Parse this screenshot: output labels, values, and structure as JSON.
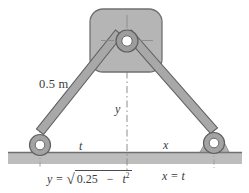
{
  "figure": {
    "labels": {
      "link_length": "0.5 m",
      "vertical_coordinate": "y",
      "left_horizontal_coordinate": "t",
      "right_horizontal_coordinate": "x"
    },
    "equations": {
      "left_y_prefix": "y =",
      "left_radical_sign": "√",
      "left_radicand_a": "0.25",
      "left_radicand_minus": "−",
      "left_radicand_t": "t",
      "left_radicand_exp": "2",
      "right": "x = t"
    },
    "colors": {
      "body_fill": "#b3b3b3",
      "body_stroke": "#6d6d6d",
      "link_fill": "#a8a8a8",
      "link_stroke": "#636363",
      "ground_fill": "#bdbdbd",
      "ground_line": "#7a7a7a",
      "pin_hole": "#ffffff",
      "center_line": "#8a8a8a",
      "text": "#3b3b3b"
    },
    "parts": {
      "slider_block": "slider block",
      "hub_pin": "pin joint at hub",
      "left_link": "left link bar",
      "right_link": "right link bar",
      "left_pivot": "left roller pin",
      "right_pivot": "right roller pin",
      "ground": "ground surface",
      "centerline": "vertical center line"
    }
  }
}
